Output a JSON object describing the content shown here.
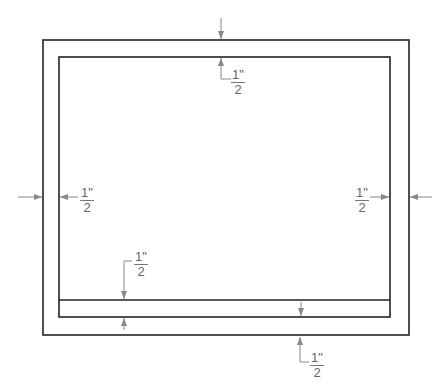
{
  "diagram": {
    "title": "",
    "margin_label": {
      "numerator": "1\"",
      "denominator": "2"
    },
    "labels": [
      {
        "id": "top",
        "numerator": "1\"",
        "denominator": "2"
      },
      {
        "id": "left",
        "numerator": "1\"",
        "denominator": "2"
      },
      {
        "id": "right",
        "numerator": "1\"",
        "denominator": "2"
      },
      {
        "id": "inner-bottom",
        "numerator": "1\"",
        "denominator": "2"
      },
      {
        "id": "bottom",
        "numerator": "1\"",
        "denominator": "2"
      }
    ],
    "colors": {
      "line": "#222222",
      "dimension": "#777777"
    }
  }
}
